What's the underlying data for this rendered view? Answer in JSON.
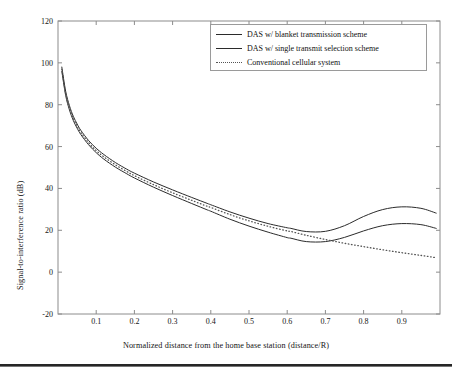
{
  "figure": {
    "background": "#ffffff",
    "line_color": "#2b2b2b",
    "dotted_color": "#555555",
    "axis_color": "#8c8c8c"
  },
  "legend": {
    "position": "top-right",
    "items": [
      {
        "label": "DAS w/ blanket transmission scheme",
        "style": "solid"
      },
      {
        "label": "DAS w/ single transmit selection scheme",
        "style": "solid"
      },
      {
        "label": "Conventional cellular system",
        "style": "dotted"
      }
    ]
  },
  "chart_data": {
    "type": "line",
    "title": "",
    "xlabel": "Normalized distance from the home base station (distance/R)",
    "ylabel": "Signal-to-interference ratio (dB)",
    "xlim": [
      0,
      1
    ],
    "ylim": [
      -20,
      120
    ],
    "xticks": [
      0.1,
      0.2,
      0.3,
      0.4,
      0.5,
      0.6,
      0.7,
      0.8,
      0.9
    ],
    "xtick_labels": [
      "0.1",
      "0.2",
      "0.3",
      "0.4",
      "0.5",
      "0.6",
      "0.7",
      "0.8",
      "0.9"
    ],
    "yticks": [
      -20,
      0,
      20,
      40,
      60,
      80,
      100,
      120
    ],
    "ytick_labels": [
      "-20",
      "0",
      "20",
      "40",
      "60",
      "80",
      "100",
      "120"
    ],
    "grid": false,
    "legend_position": "upper right",
    "x": [
      0.01,
      0.02,
      0.03,
      0.04,
      0.05,
      0.06,
      0.08,
      0.1,
      0.12,
      0.15,
      0.18,
      0.2,
      0.25,
      0.3,
      0.35,
      0.39,
      0.4,
      0.45,
      0.5,
      0.55,
      0.6,
      0.61,
      0.65,
      0.7,
      0.75,
      0.8,
      0.85,
      0.9,
      0.95,
      0.99
    ],
    "series": [
      {
        "name": "DAS w/ blanket transmission scheme",
        "style": "solid",
        "values": [
          98.0,
          86.5,
          79.5,
          74.5,
          70.8,
          67.7,
          62.9,
          59.2,
          56.2,
          52.4,
          49.2,
          47.3,
          43.1,
          39.3,
          35.7,
          32.9,
          32.2,
          28.8,
          25.8,
          23.2,
          21.2,
          20.9,
          19.4,
          19.5,
          22.2,
          26.6,
          29.9,
          31.2,
          30.5,
          28.2
        ]
      },
      {
        "name": "DAS w/ single transmit selection scheme",
        "style": "solid",
        "values": [
          96.0,
          84.5,
          77.5,
          72.5,
          68.8,
          65.7,
          60.9,
          57.1,
          54.0,
          50.2,
          47.0,
          45.0,
          40.6,
          36.6,
          32.8,
          29.8,
          29.1,
          25.3,
          22.0,
          19.1,
          16.5,
          16.2,
          14.6,
          14.6,
          16.6,
          19.7,
          22.2,
          23.2,
          22.7,
          20.9
        ]
      },
      {
        "name": "Conventional cellular system",
        "style": "dotted",
        "values": [
          97.0,
          85.5,
          78.5,
          73.5,
          69.8,
          66.7,
          61.9,
          58.1,
          55.1,
          51.3,
          48.1,
          46.1,
          41.8,
          37.9,
          34.3,
          31.5,
          30.9,
          27.5,
          24.5,
          21.9,
          19.7,
          19.4,
          17.6,
          15.6,
          13.8,
          12.2,
          10.7,
          9.3,
          8.0,
          6.9
        ]
      }
    ],
    "note_shape": "Curves decay steeply from ~98 dB near the origin to a local minimum near x=0.39-0.40, then the two DAS curves rise to local peaks near x=0.61 (about 31 dB and 23 dB) before falling again to about 4 dB and -3 dB at x=1; the conventional cellular dotted curve decreases monotonically after the minimum to about -4 dB at x=1."
  }
}
